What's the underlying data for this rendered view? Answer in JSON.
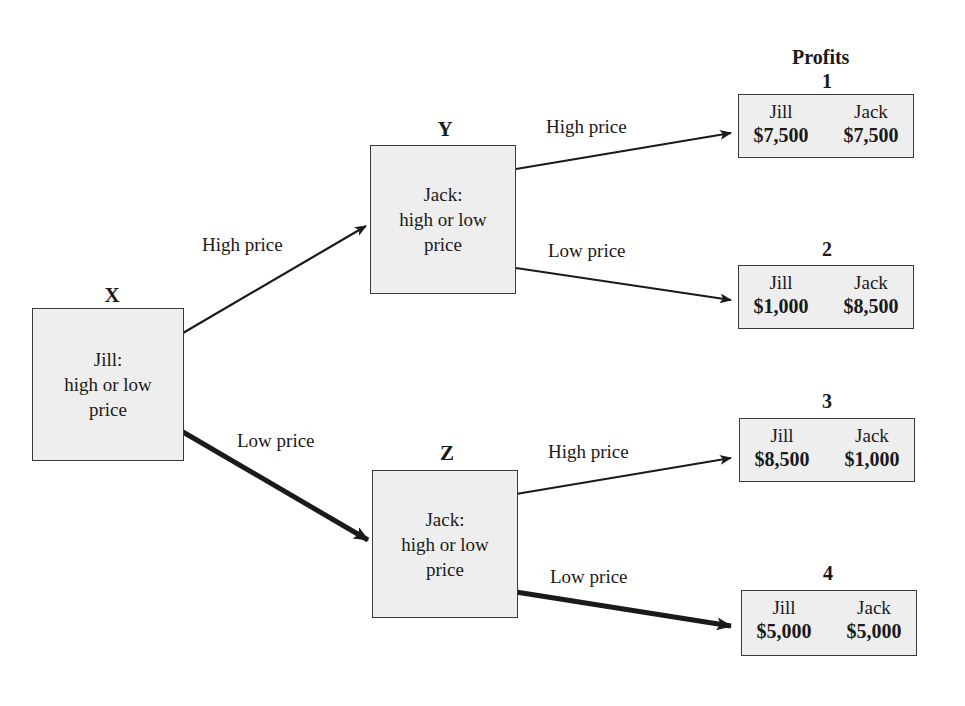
{
  "diagram": {
    "type": "game-tree",
    "profits_title": "Profits",
    "nodes": {
      "x": {
        "label": "X",
        "player": "Jill:",
        "line2": "high or low",
        "line3": "price"
      },
      "y": {
        "label": "Y",
        "player": "Jack:",
        "line2": "high or low",
        "line3": "price"
      },
      "z": {
        "label": "Z",
        "player": "Jack:",
        "line2": "high or low",
        "line3": "price"
      }
    },
    "edges": {
      "x_to_y": {
        "label": "High price",
        "emphasized": false
      },
      "x_to_z": {
        "label": "Low price",
        "emphasized": true
      },
      "y_to_1": {
        "label": "High price",
        "emphasized": false
      },
      "y_to_2": {
        "label": "Low price",
        "emphasized": false
      },
      "z_to_3": {
        "label": "High price",
        "emphasized": false
      },
      "z_to_4": {
        "label": "Low price",
        "emphasized": true
      }
    },
    "outcomes": [
      {
        "number": "1",
        "left_player": "Jill",
        "left_amount": "$7,500",
        "right_player": "Jack",
        "right_amount": "$7,500"
      },
      {
        "number": "2",
        "left_player": "Jill",
        "left_amount": "$1,000",
        "right_player": "Jack",
        "right_amount": "$8,500"
      },
      {
        "number": "3",
        "left_player": "Jill",
        "left_amount": "$8,500",
        "right_player": "Jack",
        "right_amount": "$1,000"
      },
      {
        "number": "4",
        "left_player": "Jill",
        "left_amount": "$5,000",
        "right_player": "Jack",
        "right_amount": "$5,000"
      }
    ],
    "colors": {
      "box_fill": "#eeeeee",
      "box_border": "#3a3a3a",
      "line": "#1a1a1a",
      "background": "#ffffff"
    }
  }
}
